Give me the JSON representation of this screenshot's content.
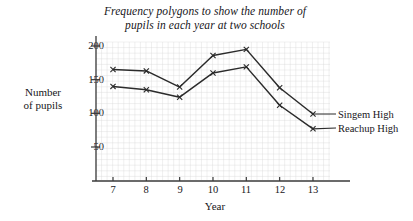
{
  "chart_data": {
    "type": "line",
    "title": "Frequency polygons to show the number of pupils in each year at two schools",
    "title_line1": "Frequency polygons to show the number of",
    "title_line2": "pupils in each year at two schools",
    "xlabel": "Year",
    "ylabel": "Number of pupils",
    "ylabel_line1": "Number",
    "ylabel_line2": "of pupils",
    "categories": [
      7,
      8,
      9,
      10,
      11,
      12,
      13
    ],
    "xtick_labels": [
      "7",
      "8",
      "9",
      "10",
      "11",
      "12",
      "13"
    ],
    "ytick_labels": [
      "50",
      "100",
      "150",
      "200"
    ],
    "ytick_values": [
      50,
      100,
      150,
      200
    ],
    "xlim": [
      6.4,
      13.9
    ],
    "ylim": [
      0,
      215
    ],
    "grid": true,
    "grid_color": "#d8d8d8",
    "line_color": "#2b2b2b",
    "marker": "x",
    "legend_position": "right-inline",
    "series": [
      {
        "name": "Singem High",
        "values": [
          165,
          163,
          139,
          186,
          195,
          138,
          99
        ]
      },
      {
        "name": "Reachup High",
        "values": [
          140,
          135,
          124,
          160,
          169,
          112,
          77
        ]
      }
    ]
  }
}
